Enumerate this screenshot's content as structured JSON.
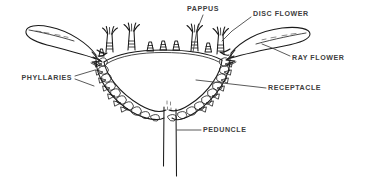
{
  "figure": {
    "background_color": "#ffffff",
    "ink_color": "#1a1a1a",
    "label_color": "#404040"
  },
  "labels": [
    {
      "id": "pappus",
      "text": "PAPPUS",
      "anchor": "middle",
      "x": 203,
      "y": 9,
      "leader": "M 203 15 L 197 30 L 193 52",
      "target": "pappus bristles atop disc flowers"
    },
    {
      "id": "disc_flower",
      "text": "DISC FLOWER",
      "anchor": "start",
      "x": 253,
      "y": 14,
      "leader": "M 251 17 L 232 31 L 222 41",
      "target": "tubular central florets"
    },
    {
      "id": "ray_flower",
      "text": "RAY FLOWER",
      "anchor": "start",
      "x": 292,
      "y": 58,
      "leader": "M 290 56 L 272 48 L 262 44",
      "target": "strap-shaped marginal floret"
    },
    {
      "id": "phyllaries",
      "text": "PHYLLARIES",
      "anchor": "end",
      "x": 72,
      "y": 78,
      "leader": "M 75 76 L 95 70 M 75 79 L 94 86",
      "target": "involucral bracts"
    },
    {
      "id": "receptacle",
      "text": "RECEPTACLE",
      "anchor": "start",
      "x": 268,
      "y": 88,
      "leader": "M 266 88 L 196 80",
      "target": "enlarged stem tip bearing florets"
    },
    {
      "id": "peduncle",
      "text": "PEDUNCLE",
      "anchor": "start",
      "x": 203,
      "y": 130,
      "leader": "M 201 130 L 177 130",
      "target": "flower head stalk"
    }
  ],
  "structures": {
    "receptacle_label": "receptacle-body",
    "involucre_label": "involucre-bracts",
    "peduncle_label": "peduncle-stalk",
    "ray_left_label": "ray-flower-left",
    "ray_right_label": "ray-flower-right",
    "disc_flowers_label": "disc-flower-row",
    "pappus_label": "pappus-bristles"
  }
}
